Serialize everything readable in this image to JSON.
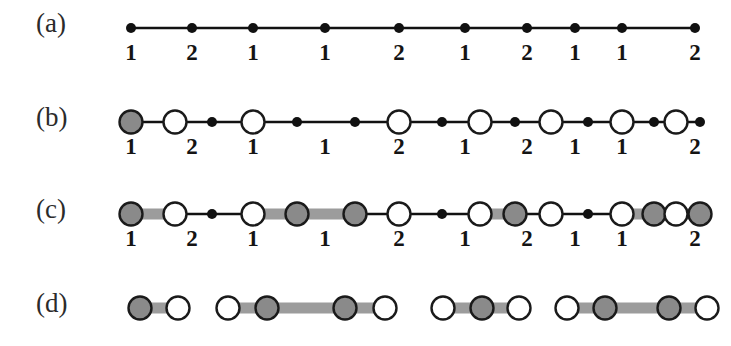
{
  "figure": {
    "background": "#ffffff",
    "colors": {
      "black": "#111111",
      "gray_fill": "#8a8a8a",
      "gray_bar": "#9c9c9c",
      "white_fill": "#ffffff",
      "outline": "#1a1a1a",
      "label_text": "#2b2b2b"
    },
    "node_x": [
      131,
      192,
      253,
      325,
      399,
      465,
      527,
      575,
      622,
      695
    ],
    "labels": [
      "1",
      "2",
      "1",
      "1",
      "2",
      "1",
      "2",
      "1",
      "1",
      "2"
    ],
    "rows": [
      {
        "tag": "(a)",
        "name": "row-a",
        "y_line": 28,
        "y_labels": 40,
        "description": "path with ten small filled vertices",
        "nodes": [
          {
            "type": "dot",
            "x": 131
          },
          {
            "type": "dot",
            "x": 192
          },
          {
            "type": "dot",
            "x": 253
          },
          {
            "type": "dot",
            "x": 325
          },
          {
            "type": "dot",
            "x": 399
          },
          {
            "type": "dot",
            "x": 465
          },
          {
            "type": "dot",
            "x": 527
          },
          {
            "type": "dot",
            "x": 575
          },
          {
            "type": "dot",
            "x": 622
          },
          {
            "type": "dot",
            "x": 695
          }
        ],
        "bars": [],
        "has_labels": true
      },
      {
        "tag": "(b)",
        "name": "row-b",
        "y_line": 122,
        "y_labels": 134,
        "description": "same path with alternating big circles marked; first vertex shaded",
        "nodes": [
          {
            "type": "gray",
            "x": 131
          },
          {
            "type": "white",
            "x": 175
          },
          {
            "type": "dot",
            "x": 212
          },
          {
            "type": "white",
            "x": 253
          },
          {
            "type": "dot",
            "x": 297
          },
          {
            "type": "dot",
            "x": 355
          },
          {
            "type": "white",
            "x": 399
          },
          {
            "type": "dot",
            "x": 442
          },
          {
            "type": "white",
            "x": 480
          },
          {
            "type": "dot",
            "x": 515
          },
          {
            "type": "white",
            "x": 551
          },
          {
            "type": "dot",
            "x": 588
          },
          {
            "type": "white",
            "x": 622
          },
          {
            "type": "dot",
            "x": 654
          },
          {
            "type": "dot",
            "x": 700
          },
          {
            "type": "white",
            "x": 676
          }
        ],
        "bars": [],
        "has_labels": true
      },
      {
        "tag": "(c)",
        "name": "row-c",
        "y_line": 214,
        "y_labels": 226,
        "description": "matching edges highlighted by thick gray bars",
        "nodes": [
          {
            "type": "gray",
            "x": 131
          },
          {
            "type": "white",
            "x": 175
          },
          {
            "type": "dot",
            "x": 212
          },
          {
            "type": "white",
            "x": 253
          },
          {
            "type": "gray",
            "x": 297
          },
          {
            "type": "gray",
            "x": 355
          },
          {
            "type": "white",
            "x": 399
          },
          {
            "type": "dot",
            "x": 442
          },
          {
            "type": "white",
            "x": 480
          },
          {
            "type": "gray",
            "x": 515
          },
          {
            "type": "white",
            "x": 551
          },
          {
            "type": "dot",
            "x": 588
          },
          {
            "type": "white",
            "x": 622
          },
          {
            "type": "gray",
            "x": 654
          },
          {
            "type": "gray",
            "x": 700
          },
          {
            "type": "white",
            "x": 676
          }
        ],
        "bars": [
          {
            "x1": 131,
            "x2": 175
          },
          {
            "x1": 253,
            "x2": 355
          },
          {
            "x1": 480,
            "x2": 515
          },
          {
            "x1": 622,
            "x2": 700
          }
        ],
        "has_labels": true
      },
      {
        "tag": "(d)",
        "name": "row-d",
        "y_line": 308,
        "y_labels": 0,
        "description": "resulting disjoint fragments after cutting the unmatched edges",
        "nodes": [
          {
            "type": "gray",
            "x": 140
          },
          {
            "type": "white",
            "x": 178
          },
          {
            "type": "white",
            "x": 228
          },
          {
            "type": "gray",
            "x": 267
          },
          {
            "type": "gray",
            "x": 345
          },
          {
            "type": "white",
            "x": 385
          },
          {
            "type": "white",
            "x": 443
          },
          {
            "type": "gray",
            "x": 482
          },
          {
            "type": "white",
            "x": 519
          },
          {
            "type": "white",
            "x": 567
          },
          {
            "type": "gray",
            "x": 605
          },
          {
            "type": "gray",
            "x": 669
          },
          {
            "type": "white",
            "x": 707
          }
        ],
        "bars": [
          {
            "x1": 140,
            "x2": 178
          },
          {
            "x1": 228,
            "x2": 385
          },
          {
            "x1": 443,
            "x2": 519
          },
          {
            "x1": 567,
            "x2": 707
          }
        ],
        "has_labels": false
      }
    ],
    "label_x": 36,
    "row_tag_dy": -14,
    "sizes": {
      "dot_r": 5,
      "circle_r": 11.5,
      "bar_h": 11,
      "line_w": 2.6,
      "outline_w": 2.4
    }
  }
}
